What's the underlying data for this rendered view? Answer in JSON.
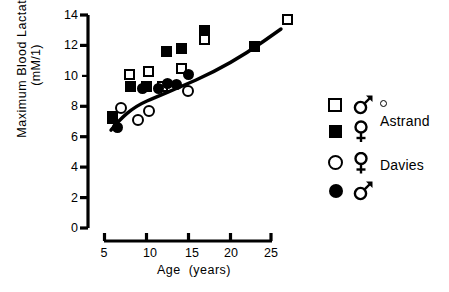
{
  "chart_data": {
    "type": "scatter",
    "title": "",
    "xlabel": "Age  (years)",
    "ylabel_line1": "Maximum  Blood  Lactate",
    "ylabel_line2": "(mM/1)",
    "xlim": [
      4,
      28
    ],
    "ylim": [
      0,
      14
    ],
    "xticks": [
      5,
      10,
      15,
      20,
      25
    ],
    "yticks": [
      0,
      2,
      4,
      6,
      8,
      10,
      12,
      14
    ],
    "grid": false,
    "legend_position": "right",
    "series": [
      {
        "name": "Astrand male",
        "marker": "open-square",
        "points": [
          {
            "x": 6.0,
            "y": 7.3
          },
          {
            "x": 8.0,
            "y": 10.1
          },
          {
            "x": 10.3,
            "y": 10.3
          },
          {
            "x": 12.0,
            "y": 9.3
          },
          {
            "x": 14.3,
            "y": 10.5
          },
          {
            "x": 17.0,
            "y": 12.4
          },
          {
            "x": 27.0,
            "y": 13.7
          }
        ]
      },
      {
        "name": "Astrand female",
        "marker": "filled-square",
        "points": [
          {
            "x": 6.0,
            "y": 7.2
          },
          {
            "x": 8.1,
            "y": 9.3
          },
          {
            "x": 10.1,
            "y": 9.3
          },
          {
            "x": 12.5,
            "y": 11.6
          },
          {
            "x": 14.3,
            "y": 11.8
          },
          {
            "x": 17.0,
            "y": 13.0
          },
          {
            "x": 23.0,
            "y": 11.9
          }
        ]
      },
      {
        "name": "Davies female",
        "marker": "open-circle",
        "points": [
          {
            "x": 7.0,
            "y": 7.9
          },
          {
            "x": 9.0,
            "y": 7.1
          },
          {
            "x": 10.3,
            "y": 7.7
          },
          {
            "x": 15.0,
            "y": 9.0
          }
        ]
      },
      {
        "name": "Davies male",
        "marker": "filled-circle",
        "points": [
          {
            "x": 6.6,
            "y": 6.6
          },
          {
            "x": 9.6,
            "y": 9.2
          },
          {
            "x": 11.5,
            "y": 9.2
          },
          {
            "x": 12.6,
            "y": 9.5
          },
          {
            "x": 13.6,
            "y": 9.4
          },
          {
            "x": 15.1,
            "y": 10.1
          }
        ]
      }
    ],
    "fit_curve": {
      "description": "rising trend line through data",
      "points": [
        {
          "x": 5.8,
          "y": 6.9
        },
        {
          "x": 7.0,
          "y": 7.9
        },
        {
          "x": 8.5,
          "y": 8.7
        },
        {
          "x": 10.3,
          "y": 9.4
        },
        {
          "x": 12.0,
          "y": 9.9
        },
        {
          "x": 14.0,
          "y": 10.6
        },
        {
          "x": 17.0,
          "y": 11.6
        },
        {
          "x": 21.0,
          "y": 12.7
        },
        {
          "x": 24.5,
          "y": 13.4
        },
        {
          "x": 27.0,
          "y": 13.7
        }
      ]
    }
  },
  "axes": {
    "ytick_labels": [
      "14",
      "12",
      "10",
      "8",
      "6",
      "4",
      "2",
      "0"
    ],
    "xtick_labels": [
      "5",
      "10",
      "15",
      "20",
      "25"
    ],
    "ylabel_line1": "Maximum  Blood  Lactate",
    "ylabel_line2": "(mM/1)",
    "xlabel": "Age  (years)"
  },
  "legend": {
    "rows": [
      {
        "marker": "open-square",
        "sex": "male",
        "extra": "degree-dot",
        "label": ""
      },
      {
        "marker": "filled-square",
        "sex": "female",
        "extra": "",
        "label": "Astrand"
      },
      {
        "marker": "open-circle",
        "sex": "female",
        "extra": "",
        "label": "Davies"
      },
      {
        "marker": "filled-circle",
        "sex": "male",
        "extra": "",
        "label": ""
      }
    ],
    "group_labels": [
      "Astrand",
      "Davies"
    ]
  }
}
